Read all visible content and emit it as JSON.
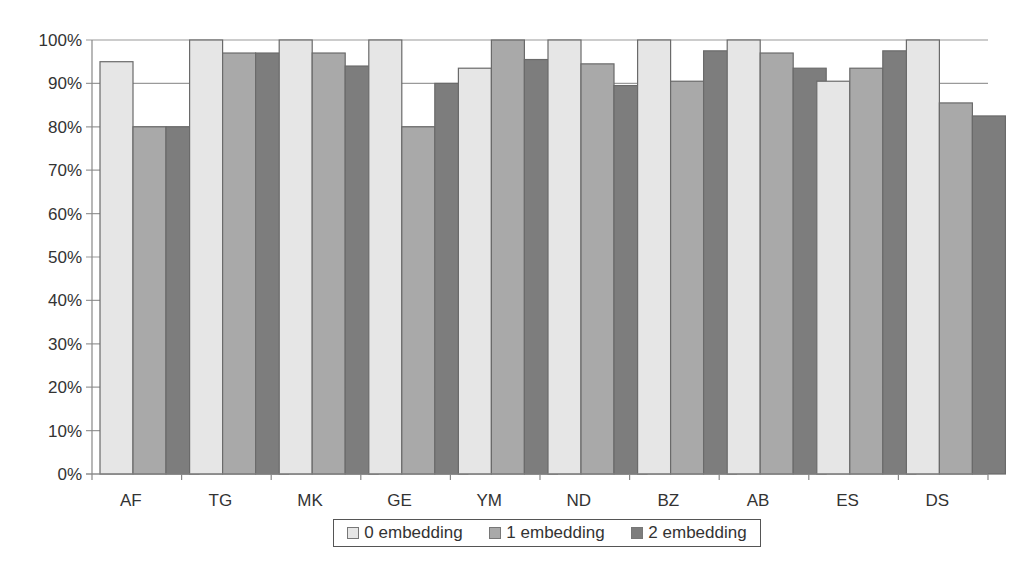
{
  "chart_data": {
    "type": "bar",
    "title": "",
    "xlabel": "",
    "ylabel": "",
    "ylim": [
      0,
      100
    ],
    "yticks": [
      "0%",
      "10%",
      "20%",
      "30%",
      "40%",
      "50%",
      "60%",
      "70%",
      "80%",
      "90%",
      "100%"
    ],
    "grid": true,
    "legend_position": "bottom",
    "categories": [
      "AF",
      "TG",
      "MK",
      "GE",
      "YM",
      "ND",
      "BZ",
      "AB",
      "ES",
      "DS"
    ],
    "series": [
      {
        "name": "0 embedding",
        "color": "#e6e6e6",
        "values": [
          95,
          100,
          100,
          100,
          93.5,
          100,
          100,
          100,
          90.5,
          100
        ]
      },
      {
        "name": "1 embedding",
        "color": "#a9a9a9",
        "values": [
          80,
          97,
          97,
          80,
          100,
          94.5,
          90.5,
          97,
          93.5,
          85.5
        ]
      },
      {
        "name": "2 embedding",
        "color": "#7d7d7d",
        "values": [
          80,
          97,
          94,
          90,
          95.5,
          89.5,
          97.5,
          93.5,
          97.5,
          82.5
        ]
      }
    ]
  },
  "legend": {
    "items": [
      {
        "label": "0 embedding",
        "color": "#e6e6e6"
      },
      {
        "label": "1 embedding",
        "color": "#a9a9a9"
      },
      {
        "label": "2 embedding",
        "color": "#7d7d7d"
      }
    ]
  }
}
